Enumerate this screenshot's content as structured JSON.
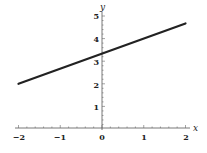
{
  "chart_data": {
    "type": "line",
    "title": "",
    "xlabel": "x",
    "ylabel": "y",
    "xlim": [
      -2,
      2
    ],
    "ylim": [
      0,
      5
    ],
    "xticks": [
      -2,
      -1,
      0,
      1,
      2
    ],
    "yticks": [
      1,
      2,
      3,
      4,
      5
    ],
    "grid": false,
    "legend": null,
    "series": [
      {
        "name": "line",
        "x": [
          -2,
          2
        ],
        "y": [
          2,
          4.67
        ],
        "slope": 0.667,
        "intercept": 3.33,
        "color": "#222222"
      }
    ]
  },
  "labels": {
    "x_axis": "x",
    "y_axis": "y",
    "xticks": [
      "−2",
      "−1",
      "0",
      "1",
      "2"
    ],
    "yticks": [
      "1",
      "2",
      "3",
      "4",
      "5"
    ]
  }
}
